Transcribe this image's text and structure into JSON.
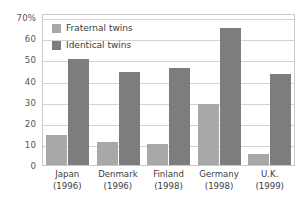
{
  "chart_data": {
    "type": "bar",
    "title": "",
    "xlabel": "",
    "ylabel": "",
    "ylim": [
      0,
      72
    ],
    "yticks": [
      {
        "value": 70,
        "label": "70%"
      },
      {
        "value": 60,
        "label": "60"
      },
      {
        "value": 50,
        "label": "50"
      },
      {
        "value": 40,
        "label": "40"
      },
      {
        "value": 30,
        "label": "30"
      },
      {
        "value": 20,
        "label": "20"
      },
      {
        "value": 10,
        "label": "10"
      },
      {
        "value": 0,
        "label": "0"
      }
    ],
    "grid": true,
    "legend_position": "top-left",
    "categories": [
      "Japan",
      "Denmark",
      "Finland",
      "Germany",
      "U.K."
    ],
    "category_years": [
      "(1996)",
      "(1996)",
      "(1998)",
      "(1998)",
      "(1999)"
    ],
    "series": [
      {
        "name": "Fraternal twins",
        "color": "#a8a8a8",
        "values": [
          14,
          11,
          10,
          29,
          5
        ]
      },
      {
        "name": "Identical twins",
        "color": "#7d7d7d",
        "values": [
          50,
          44,
          46,
          65,
          43
        ]
      }
    ]
  },
  "legend": {
    "items": [
      {
        "label": "Fraternal twins",
        "swatch": "fraternal-swatch"
      },
      {
        "label": "Identical twins",
        "swatch": "identical-swatch"
      }
    ]
  },
  "colors": {
    "fraternal": "#a8a8a8",
    "identical": "#7d7d7d",
    "gridline": "#d3d3d3",
    "plot_border": "#c9c9c9",
    "background": "#ffffff",
    "text": "#3c3c3c"
  }
}
